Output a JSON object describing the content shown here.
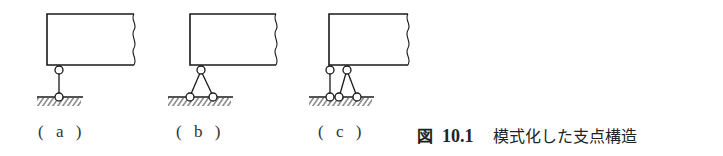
{
  "figure": {
    "caption_prefix": "図",
    "caption_number": "10.1",
    "caption_text": "模式化した支点構造",
    "line_color": "#1a1a1a"
  },
  "panels": [
    {
      "id": "a",
      "label": "( a )",
      "support_type": "single-link (roller)",
      "top_pins": 1,
      "bottom_pins": 1
    },
    {
      "id": "b",
      "label": "( b )",
      "support_type": "two-link triangle (pin)",
      "top_pins": 1,
      "bottom_pins": 2
    },
    {
      "id": "c",
      "label": "( c )",
      "support_type": "three-link (fixed)",
      "top_pins": 2,
      "bottom_pins": 3
    }
  ]
}
